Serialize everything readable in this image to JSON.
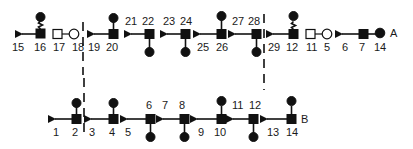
{
  "diagram": {
    "row_a": {
      "end_label": "A",
      "units": [
        {
          "arrow_label": "15",
          "node_label": "16",
          "branch": "up-wavy"
        },
        {
          "open_pair": [
            "17",
            "18"
          ]
        },
        {
          "arrow_label": "19",
          "node_label": "20",
          "branch": "up"
        },
        {
          "arrow_label": "21",
          "node_label": "22",
          "branch": "down"
        },
        {
          "arrow_label": "23",
          "node_label": "24",
          "branch": "down"
        },
        {
          "arrow_label": "25",
          "node_label": "26",
          "branch": "up"
        },
        {
          "arrow_label": "27",
          "node_label": "28",
          "branch": "down"
        },
        {
          "arrow_label": "29",
          "node_label": "12",
          "branch": "up-wavy"
        },
        {
          "open_pair": [
            "11",
            "5"
          ]
        },
        {
          "arrow_label": "6",
          "node_label": "7",
          "end_label": "14"
        }
      ]
    },
    "row_b": {
      "end_label": "B",
      "units": [
        {
          "arrow_label": "1",
          "node_label": "2",
          "branch": "up"
        },
        {
          "arrow_label": "3",
          "node_label": "4",
          "branch": "up"
        },
        {
          "arrow_label": "5",
          "node_label": "6",
          "branch": "down"
        },
        {
          "arrow_label": "7",
          "node_label": "8",
          "branch": "down"
        },
        {
          "arrow_label": "9",
          "node_label": "10",
          "branch": "up"
        },
        {
          "arrow_label": "11",
          "node_label": "12",
          "branch": "down"
        },
        {
          "arrow_label": "13",
          "node_label": "14",
          "branch": "up"
        }
      ]
    },
    "labels": {
      "a15": "15",
      "a16": "16",
      "a17": "17",
      "a18": "18",
      "a19": "19",
      "a20": "20",
      "a21": "21",
      "a22": "22",
      "a23": "23",
      "a24": "24",
      "a25": "25",
      "a26": "26",
      "a27": "27",
      "a28": "28",
      "a29": "29",
      "a12": "12",
      "a11": "11",
      "a5": "5",
      "a6": "6",
      "a7": "7",
      "a14": "14",
      "aA": "A",
      "b1": "1",
      "b2": "2",
      "b3": "3",
      "b4": "4",
      "b5": "5",
      "b6": "6",
      "b7": "7",
      "b8": "8",
      "b9": "9",
      "b10": "10",
      "b11": "11",
      "b12": "12",
      "b13": "13",
      "b14": "14",
      "bB": "B"
    },
    "colors": {
      "ink": "#111111",
      "background": "#ffffff"
    }
  }
}
